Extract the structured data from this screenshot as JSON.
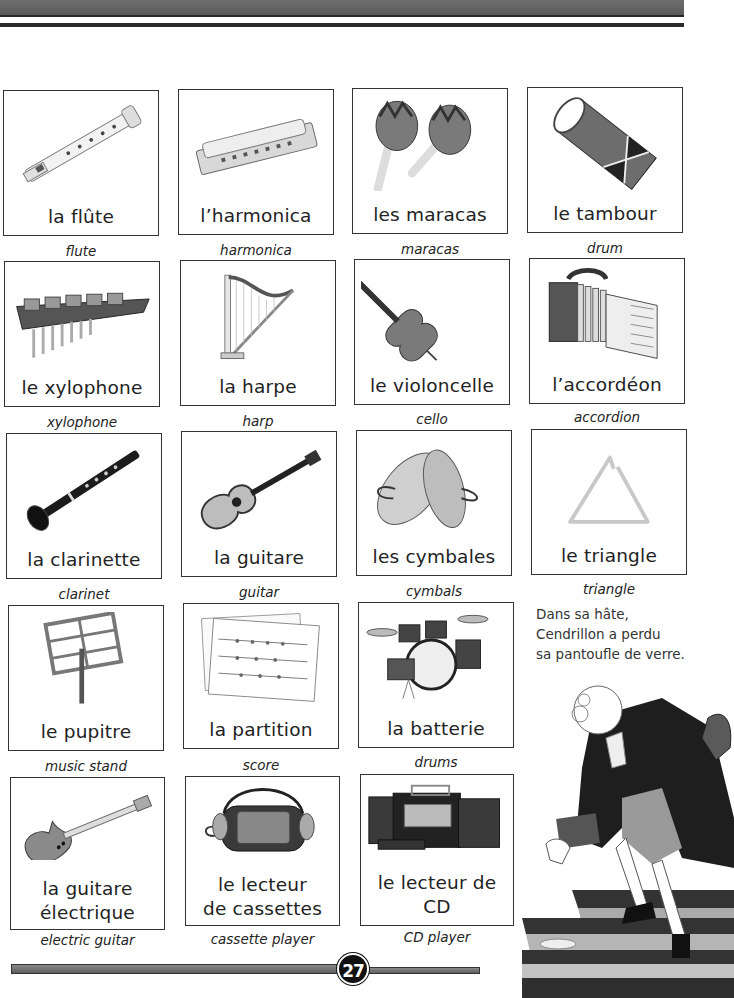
{
  "page": {
    "number": "27"
  },
  "instruments": [
    {
      "fr": "la flûte",
      "en": "flute",
      "icon": "flute-icon"
    },
    {
      "fr": "l’harmonica",
      "en": "harmonica",
      "icon": "harmonica-icon"
    },
    {
      "fr": "les maracas",
      "en": "maracas",
      "icon": "maracas-icon"
    },
    {
      "fr": "le tambour",
      "en": "drum",
      "icon": "drum-icon"
    },
    {
      "fr": "le xylophone",
      "en": "xylophone",
      "icon": "xylophone-icon"
    },
    {
      "fr": "la harpe",
      "en": "harp",
      "icon": "harp-icon"
    },
    {
      "fr": "le violoncelle",
      "en": "cello",
      "icon": "cello-icon"
    },
    {
      "fr": "l’accordéon",
      "en": "accordion",
      "icon": "accordion-icon"
    },
    {
      "fr": "la clarinette",
      "en": "clarinet",
      "icon": "clarinet-icon"
    },
    {
      "fr": "la guitare",
      "en": "guitar",
      "icon": "guitar-icon"
    },
    {
      "fr": "les cymbales",
      "en": "cymbals",
      "icon": "cymbals-icon"
    },
    {
      "fr": "le triangle",
      "en": "triangle",
      "icon": "triangle-icon"
    },
    {
      "fr": "le pupitre",
      "en": "music stand",
      "icon": "music-stand-icon"
    },
    {
      "fr": "la partition",
      "en": "score",
      "icon": "score-icon"
    },
    {
      "fr": "la batterie",
      "en": "drums",
      "icon": "drum-kit-icon"
    },
    {
      "fr_line1": "la guitare",
      "fr_line2": "électrique",
      "en": "electric guitar",
      "icon": "electric-guitar-icon"
    },
    {
      "fr_line1": "le lecteur",
      "fr_line2": "de cassettes",
      "en": "cassette player",
      "icon": "cassette-player-icon"
    },
    {
      "fr": "le lecteur de CD",
      "en": "CD player",
      "icon": "cd-player-icon"
    }
  ],
  "story": {
    "lines": [
      "Dans sa hâte,",
      "Cendrillon a perdu",
      "sa pantoufle de verre."
    ]
  },
  "illustration": {
    "icon": "prince-on-stairs-illustration"
  }
}
